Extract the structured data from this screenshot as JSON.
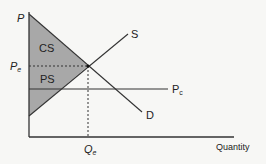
{
  "diagram": {
    "type": "supply-demand",
    "labels": {
      "y_axis": "P",
      "x_axis": "Quantity",
      "equilibrium_price": "P",
      "equilibrium_price_sub": "e",
      "equilibrium_quantity": "Q",
      "equilibrium_quantity_sub": "e",
      "supply": "S",
      "demand": "D",
      "price_ceiling": "P",
      "price_ceiling_sub": "c",
      "consumer_surplus": "CS",
      "producer_surplus": "PS"
    },
    "colors": {
      "surplus_fill": "#a8a8a8",
      "line": "#333333",
      "background": "#f7f7f5"
    }
  }
}
